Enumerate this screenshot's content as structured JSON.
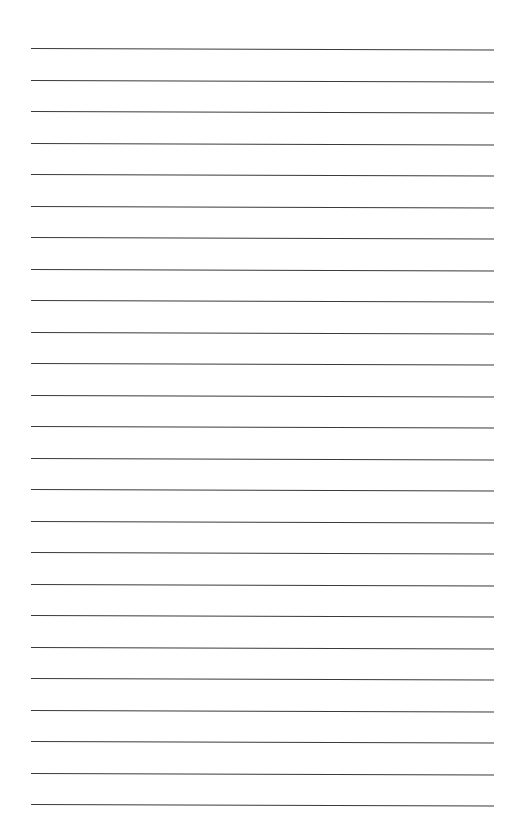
{
  "page": {
    "type": "lined-paper",
    "background_color": "#ffffff",
    "line_color": "#3a3a3a",
    "line_count": 25,
    "first_line_y": 48,
    "line_spacing": 31.5,
    "line_left_x": 31,
    "line_right_x": 494,
    "text": ""
  }
}
